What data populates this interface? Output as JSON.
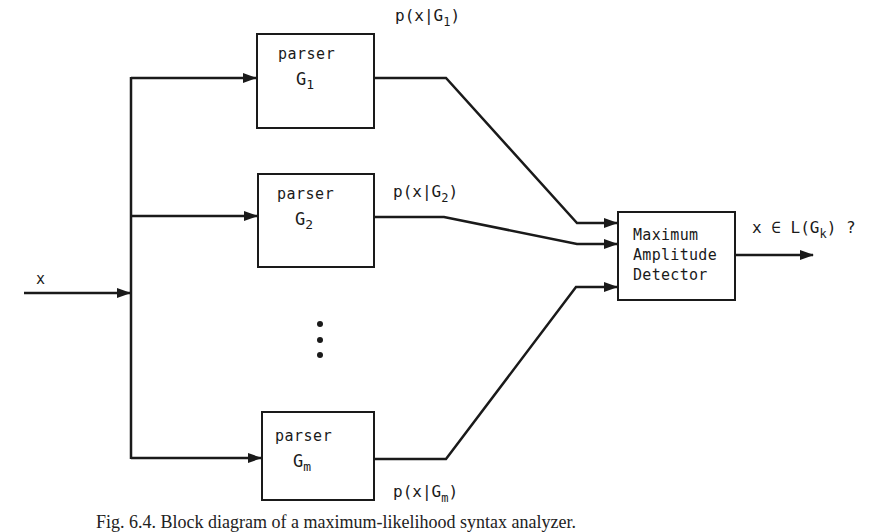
{
  "figure": {
    "input_label": "x",
    "parsers": [
      {
        "label": "parser",
        "grammar": "G",
        "subscript": "1",
        "output": {
          "prefix": "p(x|G",
          "subscript": "1",
          "suffix": ")"
        }
      },
      {
        "label": "parser",
        "grammar": "G",
        "subscript": "2",
        "output": {
          "prefix": "p(x|G",
          "subscript": "2",
          "suffix": ")"
        }
      },
      {
        "label": "parser",
        "grammar": "G",
        "subscript": "m",
        "output": {
          "prefix": "p(x|G",
          "subscript": "m",
          "suffix": ")"
        }
      }
    ],
    "ellipsis": "vertical-dots",
    "detector": {
      "line1": "Maximum",
      "line2": "Amplitude",
      "line3": "Detector"
    },
    "output_label": {
      "prefix": "x ∈ L(G",
      "subscript": "k",
      "suffix": ") ?"
    },
    "caption": "Fig. 6.4. Block diagram of a maximum-likelihood syntax analyzer."
  }
}
